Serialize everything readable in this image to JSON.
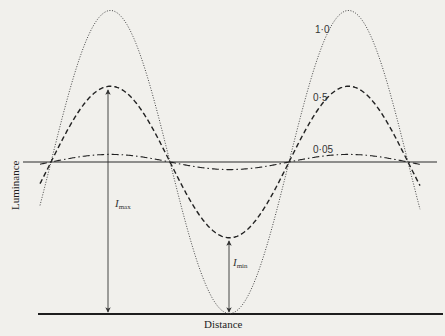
{
  "figure": {
    "xlabel": "Distance",
    "ylabel": "Luminance",
    "annotations": {
      "imax": {
        "symbol": "I",
        "subscript": "max"
      },
      "imin": {
        "symbol": "I",
        "subscript": "min"
      }
    },
    "curve_labels": [
      "1·0",
      "0·5",
      "0·05"
    ],
    "colors": {
      "ink": "#1e1e1e",
      "background": "#f1f0ec"
    }
  },
  "chart_data": {
    "type": "line",
    "title": "",
    "xlabel": "Distance",
    "ylabel": "Luminance",
    "mean_luminance": 0.5,
    "x_period": 1.0,
    "x_range": [
      -0.12,
      1.63
    ],
    "series": [
      {
        "name": "1·0",
        "contrast": 1.0,
        "style": "dotted",
        "max": 1.0,
        "min": 0.0
      },
      {
        "name": "0·5",
        "contrast": 0.5,
        "style": "dashed",
        "max": 0.75,
        "min": 0.25
      },
      {
        "name": "0·05",
        "contrast": 0.05,
        "style": "dash-dot",
        "max": 0.525,
        "min": 0.475
      }
    ],
    "annotations": [
      {
        "label": "I_max",
        "series": "0·5",
        "at": "peak",
        "value": 0.75
      },
      {
        "label": "I_min",
        "series": "0·5",
        "at": "trough",
        "value": 0.25
      }
    ],
    "grid": false,
    "legend": "inline labels"
  }
}
